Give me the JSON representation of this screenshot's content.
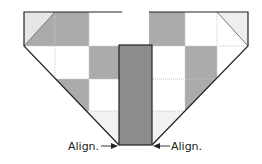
{
  "diagram": {
    "type": "quilt-block-assembly",
    "labels": {
      "left_align": "Align.",
      "right_align": "Align."
    },
    "colors": {
      "dark": "#8c8c8c",
      "medium": "#ababab",
      "light": "#e6e6e6",
      "white": "#ffffff",
      "outline": "#222222",
      "seam": "#c8c8c8"
    },
    "left_unit": {
      "rows": [
        [
          "triangle",
          "medium",
          "white"
        ],
        [
          "white",
          "white",
          "medium"
        ],
        [
          "none",
          "medium",
          "white"
        ],
        [
          "none",
          "none",
          "light"
        ]
      ]
    },
    "right_unit": {
      "rows": [
        [
          "medium",
          "white",
          "triangle"
        ],
        [
          "white",
          "medium",
          "white"
        ],
        [
          "white",
          "medium",
          "none"
        ],
        [
          "light",
          "none",
          "none"
        ]
      ]
    },
    "center_strip": {
      "color": "dark"
    }
  }
}
